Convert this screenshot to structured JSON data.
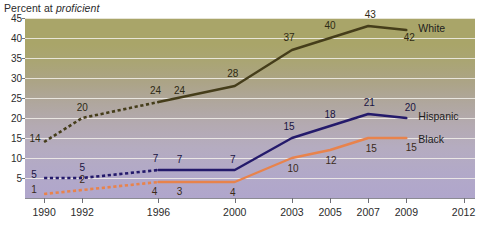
{
  "chart_data": {
    "type": "line",
    "title": "Percent at proficient",
    "title_plain": "Percent at ",
    "title_italic": "proficient",
    "xlabel": "",
    "ylabel": "",
    "grid": true,
    "legend_position": "right-inline",
    "xlim": [
      1989,
      2012.6
    ],
    "ylim": [
      0,
      45
    ],
    "yticks": [
      5,
      10,
      15,
      20,
      25,
      30,
      35,
      40,
      45
    ],
    "ytick_labels": [
      "5",
      "10",
      "15",
      "20",
      "25",
      "30",
      "35",
      "40",
      "45"
    ],
    "xticks": [
      1990,
      1992,
      1996,
      2000,
      2003,
      2005,
      2007,
      2009,
      2012
    ],
    "xtick_labels": [
      "1990",
      "1992",
      "1996",
      "2000",
      "2003",
      "2005",
      "2007",
      "2009",
      "2012"
    ],
    "x": [
      1990,
      1992,
      1996,
      2000,
      2003,
      2005,
      2007,
      2009
    ],
    "series": [
      {
        "name": "White",
        "color": "#453d1a",
        "dashed_through": 1996,
        "values": [
          14,
          20,
          24,
          28,
          37,
          40,
          43,
          42
        ],
        "labels": [
          "14",
          "20",
          "24",
          "28",
          "37",
          "40",
          "43",
          "42"
        ],
        "extra_label": {
          "text": "24",
          "x": 1997.1,
          "y": 24
        }
      },
      {
        "name": "Hispanic",
        "color": "#241a6b",
        "dashed_through": 1996,
        "values": [
          5,
          5,
          7,
          7,
          15,
          18,
          21,
          20
        ],
        "labels": [
          "5",
          "5",
          "7",
          "7",
          "15",
          "18",
          "21",
          "20"
        ],
        "extra_label": {
          "text": "7",
          "x": 1997.1,
          "y": 7
        }
      },
      {
        "name": "Black",
        "color": "#e8834c",
        "dashed_through": 1996,
        "values": [
          1,
          2,
          4,
          4,
          10,
          12,
          15,
          15
        ],
        "labels": [
          "1",
          "2",
          "4",
          "4",
          "10",
          "12",
          "15",
          "15"
        ],
        "extra_label": {
          "text": "3",
          "x": 1997.1,
          "y": 4
        }
      }
    ]
  },
  "series_labels": [
    {
      "name": "White",
      "text": "White"
    },
    {
      "name": "Hispanic",
      "text": "Hispanic"
    },
    {
      "name": "Black",
      "text": "Black"
    }
  ]
}
